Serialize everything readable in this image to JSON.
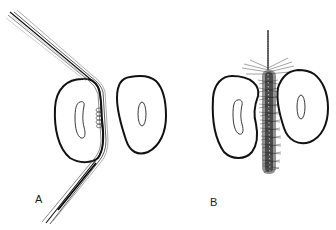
{
  "figure": {
    "panels": [
      {
        "label": "A",
        "tool": "dental floss wrapped around tooth surface",
        "elements": [
          "floss-strands",
          "left-tooth-cross-section",
          "right-tooth-cross-section",
          "plaque-deposit"
        ]
      },
      {
        "label": "B",
        "tool": "interdental brush inserted between teeth",
        "elements": [
          "brush-wire",
          "brush-bristles",
          "left-tooth-cross-section",
          "right-tooth-cross-section"
        ]
      }
    ],
    "colors": {
      "line": "#111111",
      "background": "#ffffff",
      "bristle": "#2a2a2a"
    }
  }
}
